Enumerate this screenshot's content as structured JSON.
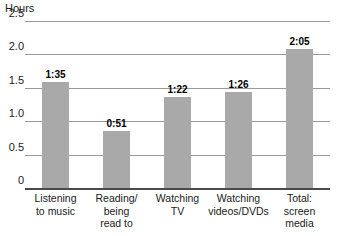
{
  "chart_data": {
    "type": "bar",
    "title": "",
    "subtitle": "",
    "xlabel": "",
    "ylabel": "Hours",
    "ylim": [
      0,
      2.5
    ],
    "grid": true,
    "legend": false,
    "y_ticks": [
      "0",
      "0.5",
      "1.0",
      "1.5",
      "2.0",
      "2.5"
    ],
    "y_tick_values": [
      0,
      0.5,
      1.0,
      1.5,
      2.0,
      2.5
    ],
    "categories": [
      "Listening to music",
      "Reading/ being read to",
      "Watching TV",
      "Watching videos/DVDs",
      "Total: screen media"
    ],
    "category_lines": [
      [
        "Listening",
        "to music"
      ],
      [
        "Reading/",
        "being",
        "read to"
      ],
      [
        "Watching",
        "TV"
      ],
      [
        "Watching",
        "videos/DVDs"
      ],
      [
        "Total:",
        "screen",
        "media"
      ]
    ],
    "data_labels": [
      "1:35",
      "0:51",
      "1:22",
      "1:26",
      "2:05"
    ],
    "values": [
      1.583,
      0.85,
      1.367,
      1.433,
      2.083
    ],
    "bar_color": "#a9a9a9",
    "gridline_color": "#9a9a9a",
    "axis_color": "#4a4a4a"
  }
}
